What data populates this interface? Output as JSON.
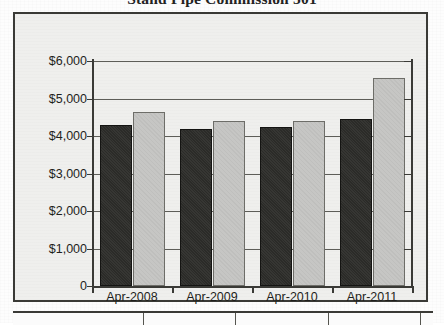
{
  "chart_data": {
    "type": "bar",
    "title": "Stand Pipe Commission 501",
    "categories": [
      "Apr-2008",
      "Apr-2009",
      "Apr-2010",
      "Apr-2011"
    ],
    "series": [
      {
        "name": "dark",
        "values": [
          4300,
          4200,
          4250,
          4450
        ]
      },
      {
        "name": "light",
        "values": [
          4650,
          4400,
          4400,
          5550
        ]
      }
    ],
    "xlabel": "",
    "ylabel": "",
    "ylim": [
      0,
      6000
    ],
    "ytick_labels": [
      "$6,000",
      "$5,000",
      "$4,000",
      "$3,000",
      "$2,000",
      "$1,000",
      "0"
    ],
    "ytick_values": [
      6000,
      5000,
      4000,
      3000,
      2000,
      1000,
      0
    ],
    "grid": true,
    "legend": "none",
    "colors": {
      "dark_bar": "#2b2b28",
      "light_bar": "#c6c6c4",
      "axis": "#3a3a36",
      "grid": "#5d5d58",
      "plot_background": "#efefed"
    }
  }
}
